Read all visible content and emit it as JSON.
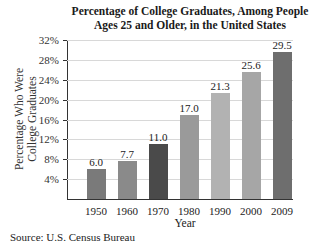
{
  "chart_data": {
    "type": "bar",
    "title": "Percentage of College Graduates, Among People Ages 25 and Older, in the United States",
    "title_lines": [
      "Percentage of College Graduates, Among People",
      "Ages 25 and Older, in the United States"
    ],
    "xlabel": "Year",
    "ylabel": "Percentage Who Were College Graduates",
    "ylabel_lines": [
      "Percentage Who Were",
      "College Graduates"
    ],
    "categories": [
      "1950",
      "1960",
      "1970",
      "1980",
      "1990",
      "2000",
      "2009"
    ],
    "values": [
      6.0,
      7.7,
      11.0,
      17.0,
      21.3,
      25.6,
      29.5
    ],
    "value_labels": [
      "6.0",
      "7.7",
      "11.0",
      "17.0",
      "21.3",
      "25.6",
      "29.5"
    ],
    "bar_colors": [
      "#7a7a7a",
      "#8a8a8a",
      "#4a4a4a",
      "#9a9a9a",
      "#b2b2b2",
      "#a6a6a6",
      "#6e6e6e"
    ],
    "ylim": [
      0,
      32
    ],
    "yticks": [
      4,
      8,
      12,
      16,
      20,
      24,
      28,
      32
    ],
    "ytick_labels": [
      "4%",
      "8%",
      "12%",
      "16%",
      "20%",
      "24%",
      "28%",
      "32%"
    ],
    "grid": true,
    "legend": null
  },
  "source": "Source: U.S. Census Bureau"
}
